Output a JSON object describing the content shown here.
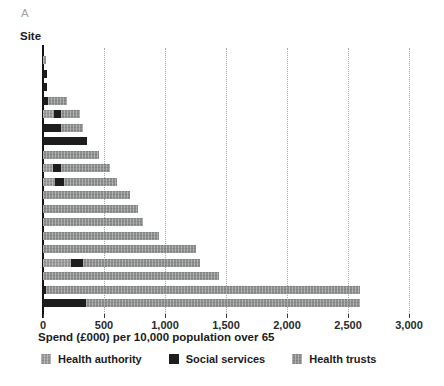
{
  "panel_label": "A",
  "colors": {
    "health_authority": "#9a9a9a",
    "social_services": "#1d1d1d",
    "health_trusts": "#8e9090",
    "axis": "#151515",
    "gridline": "#a6a6a6",
    "text": "#1c1c1c",
    "panel_label_color": "#a3a3a3"
  },
  "chart_data": {
    "type": "bar",
    "orientation": "horizontal",
    "stacked": true,
    "ylabel": "Site",
    "xlabel": "Spend (£000) per 10,000 population over 65",
    "xlim": [
      0,
      3000
    ],
    "xticks": [
      0,
      500,
      1000,
      1500,
      2000,
      2500,
      3000
    ],
    "xtick_labels": [
      "0",
      "500",
      "1,000",
      "1,500",
      "2,000",
      "2,500",
      "3,000"
    ],
    "grid": "vertical-dotted",
    "legend_position": "bottom",
    "legend": [
      {
        "key": "health_authority",
        "label": "Health authority"
      },
      {
        "key": "social_services",
        "label": "Social services"
      },
      {
        "key": "health_trusts",
        "label": "Health trusts"
      }
    ],
    "bars": [
      {
        "site_rank": 1,
        "segments": [
          {
            "series": "health_authority",
            "value": 25
          }
        ]
      },
      {
        "site_rank": 2,
        "segments": [
          {
            "series": "social_services",
            "value": 30
          }
        ]
      },
      {
        "site_rank": 3,
        "segments": [
          {
            "series": "social_services",
            "value": 35
          }
        ]
      },
      {
        "site_rank": 4,
        "segments": [
          {
            "series": "social_services",
            "value": 45
          },
          {
            "series": "health_trusts",
            "value": 155
          }
        ]
      },
      {
        "site_rank": 5,
        "segments": [
          {
            "series": "health_authority",
            "value": 90
          },
          {
            "series": "social_services",
            "value": 60
          },
          {
            "series": "health_trusts",
            "value": 150
          }
        ]
      },
      {
        "site_rank": 6,
        "segments": [
          {
            "series": "social_services",
            "value": 150
          },
          {
            "series": "health_trusts",
            "value": 180
          }
        ]
      },
      {
        "site_rank": 7,
        "segments": [
          {
            "series": "social_services",
            "value": 360
          }
        ]
      },
      {
        "site_rank": 8,
        "segments": [
          {
            "series": "health_trusts",
            "value": 460
          }
        ]
      },
      {
        "site_rank": 9,
        "segments": [
          {
            "series": "health_authority",
            "value": 80
          },
          {
            "series": "social_services",
            "value": 70
          },
          {
            "series": "health_trusts",
            "value": 400
          }
        ]
      },
      {
        "site_rank": 10,
        "segments": [
          {
            "series": "health_authority",
            "value": 100
          },
          {
            "series": "social_services",
            "value": 70
          },
          {
            "series": "health_trusts",
            "value": 440
          }
        ]
      },
      {
        "site_rank": 11,
        "segments": [
          {
            "series": "health_trusts",
            "value": 710
          }
        ]
      },
      {
        "site_rank": 12,
        "segments": [
          {
            "series": "health_trusts",
            "value": 780
          }
        ]
      },
      {
        "site_rank": 13,
        "segments": [
          {
            "series": "health_trusts",
            "value": 820
          }
        ]
      },
      {
        "site_rank": 14,
        "segments": [
          {
            "series": "health_trusts",
            "value": 950
          }
        ]
      },
      {
        "site_rank": 15,
        "segments": [
          {
            "series": "health_trusts",
            "value": 1250
          }
        ]
      },
      {
        "site_rank": 16,
        "segments": [
          {
            "series": "health_authority",
            "value": 230
          },
          {
            "series": "social_services",
            "value": 100
          },
          {
            "series": "health_trusts",
            "value": 960
          }
        ]
      },
      {
        "site_rank": 17,
        "segments": [
          {
            "series": "health_trusts",
            "value": 1440
          }
        ]
      },
      {
        "site_rank": 18,
        "segments": [
          {
            "series": "social_services",
            "value": 25
          },
          {
            "series": "health_trusts",
            "value": 2575
          }
        ]
      },
      {
        "site_rank": 19,
        "segments": [
          {
            "series": "social_services",
            "value": 355
          },
          {
            "series": "health_trusts",
            "value": 2245
          }
        ]
      }
    ]
  }
}
